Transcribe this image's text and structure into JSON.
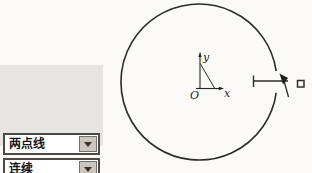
{
  "dropdowns": [
    {
      "label": "两点线",
      "icon": "chevron-down-icon"
    },
    {
      "label": "连续",
      "icon": "chevron-down-icon"
    },
    {
      "label": "非正交",
      "icon": "chevron-down-icon"
    }
  ],
  "diagram": {
    "labels": {
      "y_axis": "y",
      "x_axis": "x",
      "origin": "O"
    },
    "icons": {
      "cursor": "arrow-cursor-icon",
      "pick_box": "pick-box-icon"
    },
    "stroke_color": "#2b2b2b"
  },
  "colors": {
    "background": "#fbfaf7",
    "panel": "#e7e5e1",
    "combo_border": "#4f4a44",
    "combo_button": "#cbc7be",
    "arrow": "#41302c",
    "text": "#161616"
  }
}
